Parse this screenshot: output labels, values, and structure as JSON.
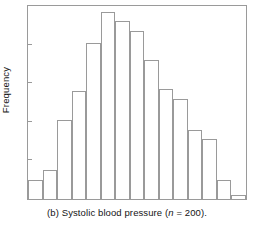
{
  "figure": {
    "caption_prefix": "(b) Systolic blood pressure (",
    "caption_var": "n",
    "caption_suffix": " = 200).",
    "caption_full": "(b) Systolic blood pressure (n = 200).",
    "ylabel": "Frequency",
    "xlabel": "",
    "frame_color": "#9a9a9a",
    "bar_edge_color": "#9a9a9a",
    "bar_fill_color": "#ffffff",
    "background_color": "#ffffff",
    "text_color": "#141414"
  },
  "chart_data": {
    "type": "bar",
    "title": "",
    "subtitle": "",
    "xlabel": "",
    "ylabel": "Frequency",
    "categories": [
      "1",
      "2",
      "3",
      "4",
      "5",
      "6",
      "7",
      "8",
      "9",
      "10",
      "11",
      "12",
      "13",
      "14",
      "15"
    ],
    "values": [
      10,
      15,
      41,
      56,
      81,
      97,
      92,
      87,
      72,
      57,
      52,
      36,
      31,
      10,
      2
    ],
    "ylim": [
      0,
      100
    ],
    "xlim": [
      0,
      15
    ],
    "grid": false,
    "legend": null,
    "annotations": [
      "(b) Systolic blood pressure (n = 200)."
    ],
    "axis_tick_labels_x": [],
    "axis_tick_labels_y": [],
    "n": 200,
    "distribution_shape": "unimodal right-skewed (approximately normal)",
    "bar_count": 15
  }
}
